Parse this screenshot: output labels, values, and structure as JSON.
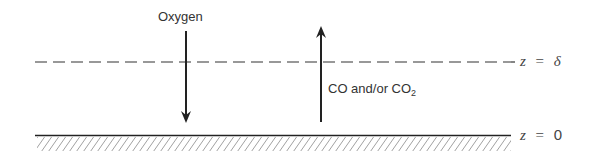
{
  "diagram": {
    "type": "boundary-layer diffusion schematic",
    "labels": {
      "oxygen": "Oxygen",
      "co_prefix": "CO and/or CO",
      "co_subscript": "2",
      "top_boundary_var": "z",
      "top_boundary_eq": "=",
      "top_boundary_val": "δ",
      "bottom_boundary_var": "z",
      "bottom_boundary_eq": "=",
      "bottom_boundary_val": "0"
    },
    "arrows": [
      {
        "label": "Oxygen",
        "direction": "down"
      },
      {
        "label": "CO and/or CO2",
        "direction": "up"
      }
    ],
    "colors": {
      "line": "#2a2a2a",
      "background": "#ffffff"
    }
  }
}
